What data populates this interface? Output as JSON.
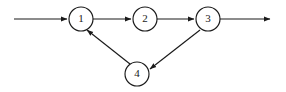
{
  "canvas": {
    "width": 286,
    "height": 92,
    "background": "#ffffff",
    "stroke_color": "#1a1a1a",
    "node_fill": "#ffffff"
  },
  "diagram": {
    "type": "directed-graph",
    "title": "",
    "node_radius": 12,
    "nodes": [
      {
        "id": "1",
        "label": "1",
        "cx": 81,
        "cy": 19
      },
      {
        "id": "2",
        "label": "2",
        "cx": 145,
        "cy": 19
      },
      {
        "id": "3",
        "label": "3",
        "cx": 208,
        "cy": 19
      },
      {
        "id": "4",
        "label": "4",
        "cx": 137,
        "cy": 74
      }
    ],
    "edges": [
      {
        "id": "entry",
        "from": "",
        "to": "1",
        "label": "",
        "arrow": true,
        "x1": 14,
        "y1": 19,
        "x2": 67,
        "y2": 19
      },
      {
        "id": "e1-2",
        "from": "1",
        "to": "2",
        "label": "",
        "arrow": true,
        "x1": 93,
        "y1": 19,
        "x2": 131,
        "y2": 19
      },
      {
        "id": "e2-3",
        "from": "2",
        "to": "3",
        "label": "",
        "arrow": true,
        "x1": 157,
        "y1": 19,
        "x2": 194,
        "y2": 19
      },
      {
        "id": "exit",
        "from": "3",
        "to": "",
        "label": "",
        "arrow": true,
        "x1": 220,
        "y1": 19,
        "x2": 270,
        "y2": 19
      },
      {
        "id": "e3-4",
        "from": "3",
        "to": "4",
        "label": "",
        "arrow": true,
        "x1": 200,
        "y1": 30,
        "x2": 150,
        "y2": 69
      },
      {
        "id": "e4-1",
        "from": "4",
        "to": "1",
        "label": "",
        "arrow": true,
        "x1": 130,
        "y1": 64,
        "x2": 87,
        "y2": 30
      }
    ]
  }
}
